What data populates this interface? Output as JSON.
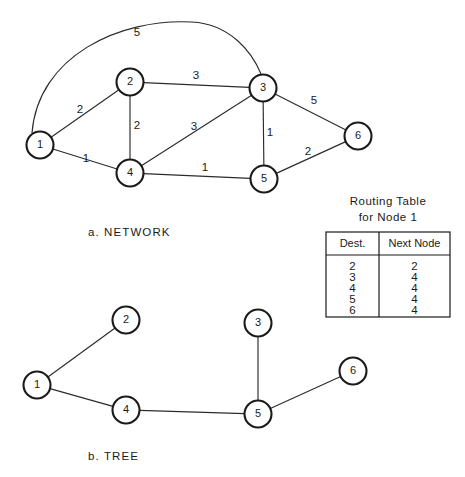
{
  "figure": {
    "width": 465,
    "height": 477,
    "background": "#ffffff",
    "ink_color": "#1a1a1a"
  },
  "network": {
    "caption": "a.  NETWORK",
    "caption_x": 88,
    "caption_y": 233,
    "node_radius": 13.5,
    "nodes": [
      {
        "id": "n1",
        "label": "1",
        "x": 40,
        "y": 145
      },
      {
        "id": "n2",
        "label": "2",
        "x": 130,
        "y": 82
      },
      {
        "id": "n3",
        "label": "3",
        "x": 263,
        "y": 88
      },
      {
        "id": "n4",
        "label": "4",
        "x": 130,
        "y": 173
      },
      {
        "id": "n5",
        "label": "5",
        "x": 264,
        "y": 179
      },
      {
        "id": "n6",
        "label": "6",
        "x": 358,
        "y": 136
      }
    ],
    "edges": [
      {
        "id": "e-1-2",
        "from": "n1",
        "to": "n2",
        "weight": "2",
        "wx": 80,
        "wy": 110
      },
      {
        "id": "e-1-4",
        "from": "n1",
        "to": "n4",
        "weight": "1",
        "wx": 86,
        "wy": 159
      },
      {
        "id": "e-2-3",
        "from": "n2",
        "to": "n3",
        "weight": "3",
        "wx": 196,
        "wy": 76
      },
      {
        "id": "e-2-4",
        "from": "n2",
        "to": "n4",
        "weight": "2",
        "wx": 137,
        "wy": 126
      },
      {
        "id": "e-4-3",
        "from": "n4",
        "to": "n3",
        "weight": "3",
        "wx": 194,
        "wy": 127
      },
      {
        "id": "e-4-5",
        "from": "n4",
        "to": "n5",
        "weight": "1",
        "wx": 205,
        "wy": 168
      },
      {
        "id": "e-3-5",
        "from": "n3",
        "to": "n5",
        "weight": "1",
        "wx": 270,
        "wy": 133
      },
      {
        "id": "e-3-6",
        "from": "n3",
        "to": "n6",
        "weight": "5",
        "wx": 314,
        "wy": 101
      },
      {
        "id": "e-5-6",
        "from": "n5",
        "to": "n6",
        "weight": "2",
        "wx": 308,
        "wy": 152
      }
    ],
    "arc_edge": {
      "id": "e-1-3-arc",
      "from": "n1",
      "to": "n3",
      "weight": "5",
      "wx": 137,
      "wy": 33,
      "path": "M 32 133 C 38 56, 120 18, 192 22 C 230 24, 252 52, 261 74"
    }
  },
  "tree": {
    "caption": "b.  TREE",
    "caption_x": 88,
    "caption_y": 457,
    "node_radius": 13.5,
    "nodes": [
      {
        "id": "t1",
        "label": "1",
        "x": 37,
        "y": 385
      },
      {
        "id": "t2",
        "label": "2",
        "x": 126,
        "y": 320
      },
      {
        "id": "t3",
        "label": "3",
        "x": 258,
        "y": 323
      },
      {
        "id": "t4",
        "label": "4",
        "x": 126,
        "y": 410
      },
      {
        "id": "t5",
        "label": "5",
        "x": 258,
        "y": 414
      },
      {
        "id": "t6",
        "label": "6",
        "x": 353,
        "y": 371
      }
    ],
    "edges": [
      {
        "id": "t-1-2",
        "from": "t1",
        "to": "t2"
      },
      {
        "id": "t-1-4",
        "from": "t1",
        "to": "t4"
      },
      {
        "id": "t-4-5",
        "from": "t4",
        "to": "t5"
      },
      {
        "id": "t-3-5",
        "from": "t3",
        "to": "t5"
      },
      {
        "id": "t-5-6",
        "from": "t5",
        "to": "t6"
      }
    ]
  },
  "routing_table": {
    "title_line1": "Routing Table",
    "title_line2": "for  Node 1",
    "title1_x": 388,
    "title1_y": 202,
    "title2_x": 388,
    "title2_y": 218,
    "box": {
      "x": 326,
      "y": 232,
      "width": 124,
      "height": 85
    },
    "divider_x": 379,
    "header_rule_y": 255,
    "columns": [
      "Dest.",
      "Next Node"
    ],
    "rows": [
      {
        "dest": "2",
        "next_node": "2"
      },
      {
        "dest": "3",
        "next_node": "4"
      },
      {
        "dest": "4",
        "next_node": "4"
      },
      {
        "dest": "5",
        "next_node": "4"
      },
      {
        "dest": "6",
        "next_node": "4"
      }
    ]
  }
}
